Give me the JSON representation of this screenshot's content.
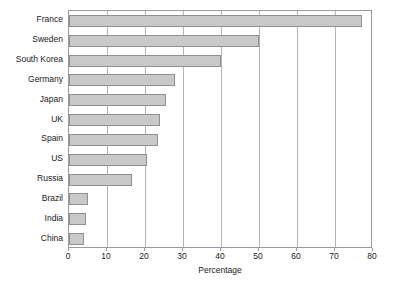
{
  "chart_data": {
    "type": "bar",
    "orientation": "horizontal",
    "title": "",
    "xlabel": "Percentage",
    "ylabel": "",
    "xlim": [
      0,
      80
    ],
    "xticks": [
      0,
      10,
      20,
      30,
      40,
      50,
      60,
      70,
      80
    ],
    "grid": true,
    "legend": false,
    "categories": [
      "France",
      "Sweden",
      "South Korea",
      "Germany",
      "Japan",
      "UK",
      "Spain",
      "US",
      "Russia",
      "Brazil",
      "India",
      "China"
    ],
    "values": [
      77,
      50,
      40,
      28,
      25.5,
      24,
      23.5,
      20.5,
      16.5,
      5,
      4.5,
      4
    ],
    "series": [
      {
        "name": "Percentage",
        "values": [
          77,
          50,
          40,
          28,
          25.5,
          24,
          23.5,
          20.5,
          16.5,
          5,
          4.5,
          4
        ]
      }
    ],
    "colors": {
      "bar_fill": "#c9c9c9",
      "bar_border": "#8f8f8f",
      "gridline": "#b4b4b4",
      "axis": "#9a9a9a",
      "text": "#1a1a1a",
      "background": "#ffffff"
    }
  }
}
